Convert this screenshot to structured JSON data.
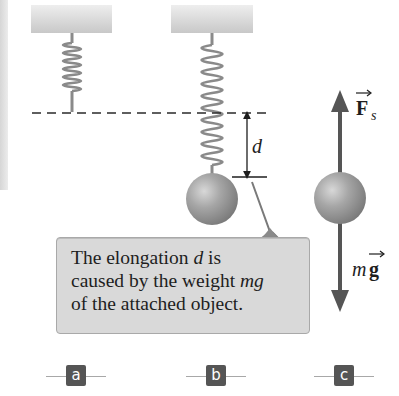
{
  "diagram": {
    "panels": [
      {
        "id": "a",
        "label": "a",
        "description": "Unstretched spring hanging from ceiling"
      },
      {
        "id": "b",
        "label": "b",
        "description": "Spring stretched by distance d with attached ball"
      },
      {
        "id": "c",
        "label": "c",
        "description": "Free-body diagram of ball"
      }
    ],
    "dimension_label": "d",
    "force_up": {
      "symbol": "F",
      "subscript": "s",
      "vector": true
    },
    "force_down": {
      "symbol_prefix": "m",
      "symbol": "g",
      "vector": true
    },
    "callout": {
      "line1_prefix": "The elongation ",
      "line1_var": "d",
      "line1_suffix": " is",
      "line2_prefix": "caused by the weight ",
      "line2_var": "mg",
      "line3": "of the attached object."
    },
    "colors": {
      "spring": "#8a8a8a",
      "ball": "#9a9a9a",
      "arrow": "#555555",
      "callout_bg": "#d9d9d9",
      "label_bg": "#555555"
    }
  }
}
